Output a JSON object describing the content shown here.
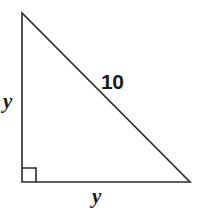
{
  "figure": {
    "type": "right-triangle-diagram",
    "background_color": "#ffffff",
    "stroke_color": "#2b2b2b",
    "text_color": "#1a1a1a",
    "stroke_width": 1.6,
    "vertices": {
      "top": [
        22,
        13
      ],
      "bottom_left": [
        22,
        182
      ],
      "bottom_right": [
        190,
        182
      ]
    },
    "right_angle": {
      "at": "bottom_left",
      "marker": "square",
      "size": 14
    },
    "labels": {
      "vertical_leg": "y",
      "horizontal_leg": "y",
      "hypotenuse": "10"
    }
  }
}
